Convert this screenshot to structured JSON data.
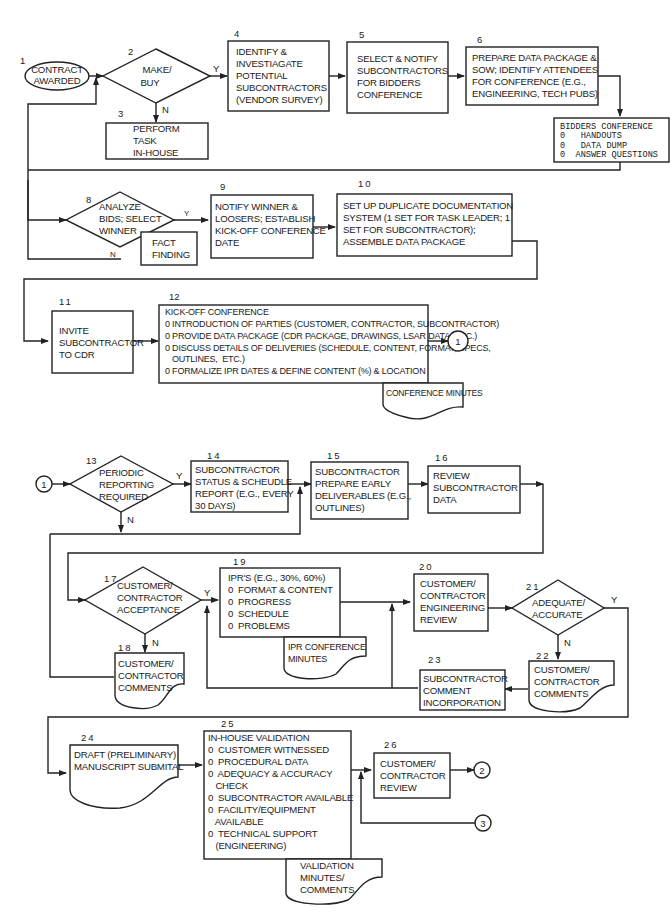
{
  "diagram": {
    "type": "flowchart",
    "title": "",
    "nodes": {
      "n1": {
        "num": "1",
        "shape": "oval",
        "lines": [
          "CONTRACT",
          "AWARDED"
        ]
      },
      "n2": {
        "num": "2",
        "shape": "decision",
        "lines": [
          "MAKE/",
          "BUY"
        ]
      },
      "n3": {
        "num": "3",
        "shape": "process",
        "lines": [
          "PERFORM",
          "TASK",
          "IN-HOUSE"
        ]
      },
      "n4": {
        "num": "4",
        "shape": "process",
        "lines": [
          "IDENTIFY &",
          "INVESTIAGATE",
          "POTENTIAL",
          "SUBCONTRACTORS",
          "(VENDOR SURVEY)"
        ]
      },
      "n5": {
        "num": "5",
        "shape": "process",
        "lines": [
          "SELECT & NOTIFY",
          "SUBCONTRACTORS",
          "FOR BIDDERS",
          "CONFERENCE"
        ]
      },
      "n6": {
        "num": "6",
        "shape": "process",
        "lines": [
          "PREPARE DATA PACKAGE &",
          "SOW; IDENTIFY ATTENDEES",
          "FOR CONFERENCE (E.G.,",
          "ENGINEERING, TECH PUBS)"
        ]
      },
      "n7": {
        "num": "",
        "shape": "process",
        "lines": [
          "BIDDERS CONFERENCE",
          "0   HANDOUTS",
          "0   DATA DUMP",
          "0  ANSWER QUESTIONS"
        ]
      },
      "n8": {
        "num": "8",
        "shape": "decision",
        "lines": [
          "ANALYZE",
          "BIDS; SELECT",
          "WINNER"
        ]
      },
      "n8b": {
        "num": "",
        "shape": "process",
        "lines": [
          "FACT",
          "FINDING"
        ]
      },
      "n9": {
        "num": "9",
        "shape": "process",
        "lines": [
          "NOTIFY WINNER &",
          "LOOSERS; ESTABLISH",
          "KICK-OFF CONFERENCE",
          "DATE"
        ]
      },
      "n10": {
        "num": "10",
        "shape": "process",
        "lines": [
          "SET UP DUPLICATE DOCUMENTATION",
          "SYSTEM (1 SET FOR TASK LEADER;  1",
          "SET FOR SUBCONTRACTOR);",
          "ASSEMBLE DATA PACKAGE"
        ]
      },
      "n11": {
        "num": "11",
        "shape": "process",
        "lines": [
          "INVITE",
          "SUBCONTRACTOR",
          "TO CDR"
        ]
      },
      "n12": {
        "num": "12",
        "shape": "process",
        "lines": [
          "KICK-OFF CONFERENCE",
          "0 INTRODUCTION OF PARTIES (CUSTOMER, CONTRACTOR, SUBCONTRACTOR)",
          "0 PROVIDE DATA PACKAGE (CDR PACKAGE, DRAWINGS, LSAR DATA, ETC.)",
          "0 DISCUSS DETAILS OF DELIVERIES (SCHEDULE, CONTENT, FORMAT, SPECS,",
          "   OUTLINES,  ETC.)",
          "0 FORMALIZE IPR DATES & DEFINE CONTENT (%) & LOCATION"
        ]
      },
      "n12doc": {
        "num": "",
        "shape": "document",
        "lines": [
          "CONFERENCE MINUTES"
        ]
      },
      "n13": {
        "num": "13",
        "shape": "decision",
        "lines": [
          "PERIODIC",
          "REPORTING",
          "REQUIRED"
        ]
      },
      "n14": {
        "num": "14",
        "shape": "process",
        "lines": [
          "SUBCONTRACTOR",
          "STATUS & SCHEUDLE",
          "REPORT (E.G., EVERY",
          "30 DAYS)"
        ]
      },
      "n15": {
        "num": "15",
        "shape": "process",
        "lines": [
          "SUBCONTRACTOR",
          "PREPARE EARLY",
          "DELIVERABLES (E.G.,",
          "OUTLINES)"
        ]
      },
      "n16": {
        "num": "16",
        "shape": "process",
        "lines": [
          "REVIEW",
          "SUBCONTRACTOR",
          "DATA"
        ]
      },
      "n17": {
        "num": "17",
        "shape": "decision",
        "lines": [
          "CUSTOMER/",
          "CONTRACTOR",
          "ACCEPTANCE"
        ]
      },
      "n18": {
        "num": "18",
        "shape": "document",
        "lines": [
          "CUSTOMER/",
          "CONTRACTOR",
          "COMMENTS"
        ]
      },
      "n19": {
        "num": "19",
        "shape": "process",
        "lines": [
          "IPR'S (E.G., 30%, 60%)",
          "0  FORMAT & CONTENT",
          "0  PROGRESS",
          "0  SCHEDULE",
          "0  PROBLEMS"
        ]
      },
      "n19doc": {
        "num": "",
        "shape": "document",
        "lines": [
          "IPR CONFERENCE",
          "MINUTES"
        ]
      },
      "n20": {
        "num": "20",
        "shape": "process",
        "lines": [
          "CUSTOMER/",
          "CONTRACTOR",
          "ENGINEERING",
          "REVIEW"
        ]
      },
      "n21": {
        "num": "21",
        "shape": "decision",
        "lines": [
          "ADEQUATE/",
          "ACCURATE"
        ]
      },
      "n22": {
        "num": "22",
        "shape": "document",
        "lines": [
          "CUSTOMER/",
          "CONTRACTOR",
          "COMMENTS"
        ]
      },
      "n23": {
        "num": "23",
        "shape": "process",
        "lines": [
          "SUBCONTRACTOR",
          "COMMENT",
          "INCORPORATION"
        ]
      },
      "n24": {
        "num": "24",
        "shape": "document",
        "lines": [
          "DRAFT (PRELIMINARY)",
          "MANUSCRIPT SUBMITAL"
        ]
      },
      "n25": {
        "num": "25",
        "shape": "process",
        "lines": [
          "IN-HOUSE VALIDATION",
          "0  CUSTOMER WITNESSED",
          "0  PROCEDURAL DATA",
          "0  ADEQUACY & ACCURACY",
          "   CHECK",
          "0  SUBCONTRACTOR AVAILABLE",
          "0  FACILITY/EQUIPMENT",
          "   AVAILABLE",
          "0  TECHNICAL SUPPORT",
          "   (ENGINEERING)"
        ]
      },
      "n25doc": {
        "num": "",
        "shape": "document",
        "lines": [
          "VALIDATION",
          "MINUTES/",
          "COMMENTS"
        ]
      },
      "n26": {
        "num": "26",
        "shape": "process",
        "lines": [
          "CUSTOMER/",
          "CONTRACTOR",
          "REVIEW"
        ]
      }
    },
    "connectors": {
      "c1a": "1",
      "c1b": "1",
      "c2": "2",
      "c3": "3"
    },
    "labels": {
      "yes": "Y",
      "no": "N"
    }
  }
}
